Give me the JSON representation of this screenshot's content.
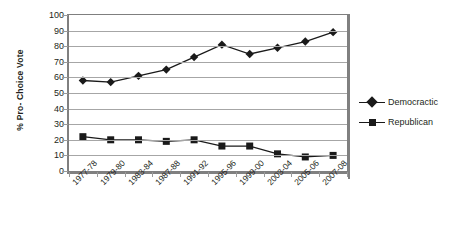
{
  "chart_data": {
    "type": "line",
    "title": "",
    "xlabel": "",
    "ylabel": "% Pro- Choice Vote",
    "ylim": [
      0,
      100
    ],
    "ytick_step": 10,
    "grid": true,
    "legend_position": "right",
    "categories": [
      "1977-78",
      "1979-80",
      "1983-84",
      "1987-88",
      "1991-92",
      "1995-96",
      "1999-00",
      "2003-04",
      "2005-06",
      "2007-08"
    ],
    "ytick_labels": [
      "0",
      "10",
      "20",
      "30",
      "40",
      "50",
      "60",
      "70",
      "80",
      "90",
      "100"
    ],
    "series": [
      {
        "name": "Democractic",
        "marker": "diamond",
        "color": "#1a1a1a",
        "values": [
          58,
          57,
          61,
          65,
          73,
          81,
          75,
          79,
          83,
          89
        ]
      },
      {
        "name": "Republican",
        "marker": "square",
        "color": "#1a1a1a",
        "values": [
          22,
          20,
          20,
          19,
          20,
          16,
          16,
          11,
          9,
          10
        ]
      }
    ]
  }
}
